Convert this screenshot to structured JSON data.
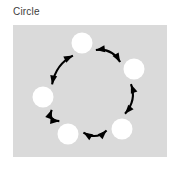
{
  "figure": {
    "title": "Circle",
    "panel": {
      "background_color": "#dadada",
      "x": 13,
      "y": 25,
      "width": 154,
      "height": 132
    },
    "page_background_color": "#ffffff",
    "title_color": "#3c3c3c"
  },
  "chart_data": {
    "type": "diagram",
    "title": "Circle",
    "layout": "circular",
    "node_count": 5,
    "edge_count": 5,
    "node_color": "#ffffff",
    "edge_color": "#000000",
    "arrowheads": "both",
    "xlabel": "",
    "ylabel": "",
    "legend": [],
    "grid": false,
    "nodes": [
      {
        "id": "n1",
        "label": "",
        "position": "top",
        "cx": 69,
        "cy": 18,
        "r": 10.5
      },
      {
        "id": "n2",
        "label": "",
        "position": "right",
        "cx": 121,
        "cy": 44,
        "r": 10.5
      },
      {
        "id": "n3",
        "label": "",
        "position": "bottom-right",
        "cx": 109,
        "cy": 104,
        "r": 10.5
      },
      {
        "id": "n4",
        "label": "",
        "position": "bottom-left",
        "cx": 55,
        "cy": 109,
        "r": 10.5
      },
      {
        "id": "n5",
        "label": "",
        "position": "left",
        "cx": 30,
        "cy": 72,
        "r": 10.5
      }
    ],
    "edges": [
      {
        "id": "e1",
        "from": "n1",
        "to": "n2",
        "bidirectional": true,
        "label": ""
      },
      {
        "id": "e2",
        "from": "n2",
        "to": "n3",
        "bidirectional": true,
        "label": ""
      },
      {
        "id": "e3",
        "from": "n3",
        "to": "n4",
        "bidirectional": true,
        "label": ""
      },
      {
        "id": "e4",
        "from": "n4",
        "to": "n5",
        "bidirectional": true,
        "label": ""
      },
      {
        "id": "e5",
        "from": "n5",
        "to": "n1",
        "bidirectional": true,
        "label": ""
      }
    ]
  }
}
